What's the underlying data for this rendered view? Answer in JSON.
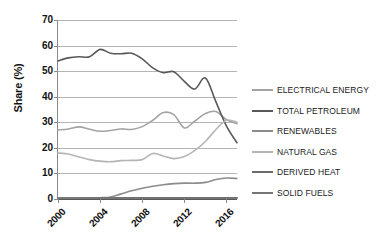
{
  "chart_data": {
    "type": "line",
    "title": "",
    "xlabel": "",
    "ylabel": "Share (%)",
    "ylim": [
      0,
      70
    ],
    "xlim": [
      2000,
      2017
    ],
    "grid": true,
    "legend_position": "right",
    "ytick_labels": [
      "0",
      "10",
      "20",
      "30",
      "40",
      "50",
      "60",
      "70"
    ],
    "ytick_values": [
      0,
      10,
      20,
      30,
      40,
      50,
      60,
      70
    ],
    "xtick_labels": [
      "2000",
      "2004",
      "2008",
      "2012",
      "2016"
    ],
    "xtick_values": [
      2000,
      2004,
      2008,
      2012,
      2016
    ],
    "x": [
      2000,
      2001,
      2002,
      2003,
      2004,
      2005,
      2006,
      2007,
      2008,
      2009,
      2010,
      2011,
      2012,
      2013,
      2014,
      2015,
      2016,
      2017
    ],
    "series": [
      {
        "name": "ELECTRICAL ENERGY",
        "color": "#a3a3a3",
        "values": [
          27.0,
          27.4,
          28.2,
          27.3,
          26.5,
          26.8,
          27.4,
          27.2,
          28.3,
          30.8,
          33.8,
          33.0,
          27.8,
          30.5,
          33.4,
          34.2,
          31.0,
          29.5
        ]
      },
      {
        "name": "TOTAL PETROLEUM",
        "color": "#595959",
        "values": [
          54.0,
          55.2,
          55.6,
          55.6,
          58.5,
          57.0,
          56.8,
          57.0,
          54.8,
          51.3,
          49.4,
          49.8,
          46.0,
          43.0,
          47.3,
          38.0,
          28.5,
          22.0
        ]
      },
      {
        "name": "RENEWABLES",
        "color": "#8c8c8c",
        "values": [
          0.3,
          0.3,
          0.3,
          0.4,
          0.5,
          0.8,
          2.0,
          3.2,
          4.2,
          5.0,
          5.6,
          6.0,
          6.2,
          6.2,
          6.5,
          7.6,
          8.2,
          8.0
        ]
      },
      {
        "name": "NATURAL GAS",
        "color": "#b5b5b5",
        "values": [
          18.0,
          17.6,
          16.4,
          15.4,
          14.8,
          14.6,
          15.0,
          15.1,
          15.4,
          17.8,
          16.8,
          15.8,
          16.6,
          19.0,
          22.5,
          27.2,
          30.8,
          30.0
        ]
      },
      {
        "name": "DERIVED HEAT",
        "color": "#6b6b6b",
        "values": [
          0.4,
          0.4,
          0.4,
          0.4,
          0.4,
          0.4,
          0.5,
          0.5,
          0.5,
          0.5,
          0.5,
          0.5,
          0.5,
          0.5,
          0.5,
          0.5,
          0.5,
          0.5
        ]
      },
      {
        "name": "SOLID FUELS",
        "color": "#767676",
        "values": [
          0.3,
          0.3,
          0.3,
          0.3,
          0.3,
          0.3,
          0.3,
          0.3,
          0.3,
          0.3,
          0.3,
          0.3,
          0.3,
          0.3,
          0.3,
          0.3,
          0.3,
          0.3
        ]
      }
    ]
  },
  "legend": {
    "items": [
      {
        "label": "ELECTRICAL ENERGY",
        "color": "#a3a3a3"
      },
      {
        "label": "TOTAL PETROLEUM",
        "color": "#595959"
      },
      {
        "label": "RENEWABLES",
        "color": "#8c8c8c"
      },
      {
        "label": "NATURAL GAS",
        "color": "#b5b5b5"
      },
      {
        "label": "DERIVED HEAT",
        "color": "#6b6b6b"
      },
      {
        "label": "SOLID FUELS",
        "color": "#767676"
      }
    ]
  }
}
